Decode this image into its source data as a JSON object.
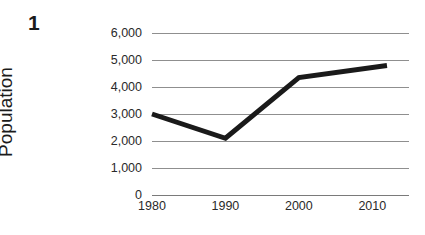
{
  "figure": {
    "number_label": "1"
  },
  "chart_data": {
    "type": "line",
    "title": "",
    "xlabel": "",
    "ylabel": "Population",
    "x": [
      1980,
      1990,
      2000,
      2012
    ],
    "values": [
      3000,
      2100,
      4350,
      4800
    ],
    "categories": [
      "1980",
      "1990",
      "2000",
      "2012"
    ],
    "series": [
      {
        "name": "Population",
        "values": [
          3000,
          2100,
          4350,
          4800
        ]
      }
    ],
    "xlim": [
      1980,
      2015
    ],
    "ylim": [
      0,
      6000
    ],
    "x_tick_values": [
      1980,
      1990,
      2000,
      2010
    ],
    "x_tick_labels": [
      "1980",
      "1990",
      "2000",
      "2010"
    ],
    "y_tick_values": [
      0,
      1000,
      2000,
      3000,
      4000,
      5000,
      6000
    ],
    "y_tick_labels": [
      "0",
      "1,000",
      "2,000",
      "3,000",
      "4,000",
      "5,000",
      "6,000"
    ],
    "grid": "horizontal",
    "legend": "none",
    "line_color": "#1a1a1a",
    "grid_color": "#8f8f8f",
    "background_color": "#ffffff",
    "line_width": 5
  }
}
